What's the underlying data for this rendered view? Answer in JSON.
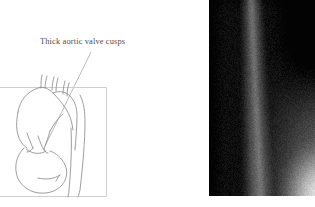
{
  "figure": {
    "kind": "medical-figure",
    "panels": [
      "schematic-line-drawing",
      "radiograph"
    ],
    "background_color": "#ffffff"
  },
  "left_panel": {
    "name": "aortic-root-schematic",
    "annotation": {
      "text": "Thick aortic valve cusps",
      "color": "#4d4d4d",
      "leader_line": {
        "from_x": 91,
        "from_y": 52,
        "to_x": 45,
        "to_y": 146,
        "color": "#a8a8a8"
      }
    },
    "frame": {
      "x": 0,
      "y": 87,
      "width": 107,
      "height": 110,
      "stroke_color": "#c9c9c9"
    },
    "structures": [
      "ascending-aorta",
      "aortic-arch",
      "brachiocephalic-branch-vessels",
      "descending-aorta",
      "aortic-valve-cusps",
      "left-ventricle"
    ],
    "line_color": "#8c8c8c"
  },
  "right_panel": {
    "name": "lateral-chest-radiograph",
    "x": 209,
    "y": 0,
    "width": 106,
    "height": 196,
    "description": "Grayscale lateral radiograph showing a dark paraspinal band, a lighter vertical soft-tissue column and a bright lower-right corner",
    "tone_range": {
      "darkest": "#0b0b0b",
      "brightest": "#d8d8d8"
    }
  }
}
